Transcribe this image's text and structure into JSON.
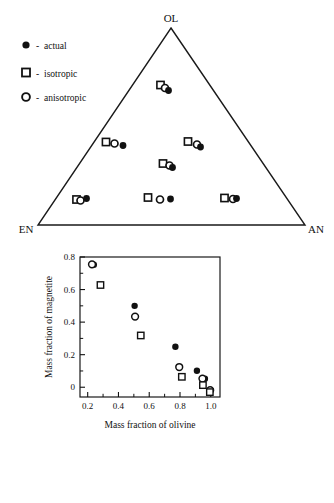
{
  "figure": {
    "cut_off_header": "",
    "panels": [
      "ternary-diagram",
      "scatter-plot"
    ]
  },
  "ternary": {
    "vertices": {
      "top": "OL",
      "bottom_left": "EN",
      "bottom_right": "AN"
    },
    "legend": [
      {
        "marker": "filled-circle",
        "dash": "-",
        "label": "actual"
      },
      {
        "marker": "open-square",
        "dash": "-",
        "label": "isotropic"
      },
      {
        "marker": "open-circle",
        "dash": "-",
        "label": "anisotropic"
      }
    ],
    "clusters": [
      {
        "name": "cluster-top",
        "square": [
          160.5,
          85.0
        ],
        "circle": [
          165.0,
          88.0
        ],
        "dot": [
          168.5,
          90.5
        ]
      },
      {
        "name": "cluster-mid-left",
        "square": [
          106.0,
          142.0
        ],
        "circle": [
          114.5,
          143.5
        ],
        "dot": [
          123.0,
          145.5
        ]
      },
      {
        "name": "cluster-mid-right",
        "square": [
          188.0,
          141.5
        ],
        "circle": [
          197.0,
          144.5
        ],
        "dot": [
          200.5,
          147.0
        ]
      },
      {
        "name": "cluster-center",
        "square": [
          163.0,
          163.5
        ],
        "circle": [
          169.5,
          165.5
        ],
        "dot": [
          172.5,
          167.5
        ]
      },
      {
        "name": "cluster-bottom-left",
        "square": [
          76.5,
          199.5
        ],
        "circle": [
          80.5,
          200.5
        ],
        "dot": [
          86.5,
          198.5
        ]
      },
      {
        "name": "cluster-bottom-mid",
        "square": [
          148.0,
          197.5
        ],
        "circle": [
          160.0,
          199.5
        ],
        "dot": [
          170.5,
          199.0
        ]
      },
      {
        "name": "cluster-bottom-right",
        "square": [
          224.5,
          198.0
        ],
        "circle": [
          233.0,
          199.0
        ],
        "dot": [
          236.5,
          198.5
        ]
      }
    ]
  },
  "chart_data": {
    "type": "scatter",
    "title": "",
    "xlabel": "Mass fraction of olivine",
    "ylabel": "Mass fraction of magnetite",
    "xlim": [
      0.15,
      1.06
    ],
    "ylim": [
      -0.06,
      0.8
    ],
    "xticks": [
      0.2,
      0.4,
      0.6,
      0.8,
      1.0
    ],
    "xticklabels": [
      "0.2",
      "0.4",
      "0.6",
      "0.8",
      "1.0"
    ],
    "yticks": [
      0,
      0.2,
      0.4,
      0.6,
      0.8
    ],
    "yticklabels": [
      "0",
      "0.2",
      "0.4",
      "0.6",
      "0.8"
    ],
    "minor_ticks": true,
    "grid": false,
    "legend_position": "none",
    "series": [
      {
        "name": "actual",
        "marker": "filled-circle",
        "points": [
          [
            0.24,
            0.753
          ],
          [
            0.505,
            0.5
          ],
          [
            0.77,
            0.249
          ],
          [
            0.91,
            0.101
          ],
          [
            0.962,
            0.052
          ]
        ]
      },
      {
        "name": "anisotropic",
        "marker": "open-circle",
        "points": [
          [
            0.228,
            0.755
          ],
          [
            0.508,
            0.434
          ],
          [
            0.795,
            0.124
          ],
          [
            0.946,
            0.053
          ],
          [
            0.996,
            -0.018
          ]
        ]
      },
      {
        "name": "isotropic",
        "marker": "open-square",
        "points": [
          [
            0.283,
            0.628
          ],
          [
            0.545,
            0.318
          ],
          [
            0.812,
            0.064
          ],
          [
            0.949,
            0.013
          ],
          [
            0.994,
            -0.03
          ]
        ]
      }
    ]
  }
}
